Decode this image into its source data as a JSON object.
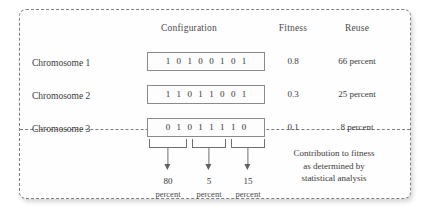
{
  "figure": {
    "headers": {
      "configuration": "Configuration",
      "fitness": "Fitness",
      "reuse": "Reuse"
    },
    "rows": [
      {
        "label": "Chromosome 1",
        "bits": [
          "1",
          "0",
          "1",
          "0",
          "0",
          "1",
          "0",
          "1"
        ],
        "fitness": "0.8",
        "reuse": "66 percent"
      },
      {
        "label": "Chromosome 2",
        "bits": [
          "1",
          "1",
          "0",
          "1",
          "1",
          "0",
          "0",
          "1"
        ],
        "fitness": "0.3",
        "reuse": "25 percent"
      },
      {
        "label": "Chromosome 3",
        "bits": [
          "0",
          "1",
          "0",
          "1",
          "1",
          "1",
          "1",
          "0"
        ],
        "fitness": "0.1",
        "reuse": "8 percent"
      }
    ],
    "contributions": [
      {
        "value": "80",
        "unit": "percent"
      },
      {
        "value": "5",
        "unit": "percent"
      },
      {
        "value": "15",
        "unit": "percent"
      }
    ],
    "note": {
      "line1": "Contribution to fitness",
      "line2": "as determined by",
      "line3": "statistical analysis"
    },
    "colors": {
      "border": "#7e7e7e",
      "box_border": "#8a8a8a",
      "text": "#3a3a3a",
      "arrow": "#5f5f5f"
    }
  }
}
